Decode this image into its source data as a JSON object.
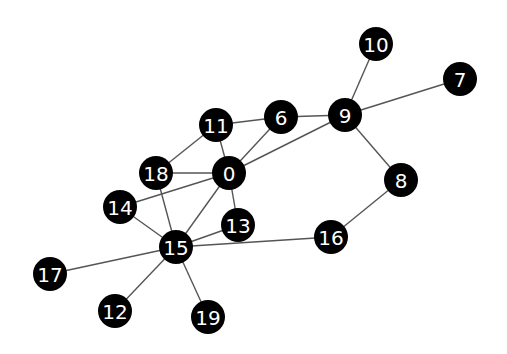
{
  "diagram": {
    "type": "undirected-graph",
    "node_color": "#000000",
    "label_color": "#ffffff",
    "edge_color": "#555555",
    "node_radius": 17,
    "nodes": [
      {
        "id": "0",
        "x": 229,
        "y": 173
      },
      {
        "id": "6",
        "x": 281,
        "y": 117
      },
      {
        "id": "7",
        "x": 460,
        "y": 79
      },
      {
        "id": "8",
        "x": 401,
        "y": 180
      },
      {
        "id": "9",
        "x": 345,
        "y": 115
      },
      {
        "id": "10",
        "x": 376,
        "y": 44
      },
      {
        "id": "11",
        "x": 216,
        "y": 125
      },
      {
        "id": "12",
        "x": 115,
        "y": 311
      },
      {
        "id": "13",
        "x": 238,
        "y": 225
      },
      {
        "id": "14",
        "x": 120,
        "y": 207
      },
      {
        "id": "15",
        "x": 176,
        "y": 247
      },
      {
        "id": "16",
        "x": 331,
        "y": 237
      },
      {
        "id": "17",
        "x": 50,
        "y": 274
      },
      {
        "id": "18",
        "x": 156,
        "y": 173
      },
      {
        "id": "19",
        "x": 208,
        "y": 317
      }
    ],
    "edges": [
      [
        "11",
        "6"
      ],
      [
        "11",
        "18"
      ],
      [
        "11",
        "0"
      ],
      [
        "18",
        "0"
      ],
      [
        "18",
        "15"
      ],
      [
        "0",
        "6"
      ],
      [
        "0",
        "9"
      ],
      [
        "0",
        "14"
      ],
      [
        "0",
        "13"
      ],
      [
        "0",
        "15"
      ],
      [
        "6",
        "9"
      ],
      [
        "9",
        "10"
      ],
      [
        "9",
        "7"
      ],
      [
        "9",
        "8"
      ],
      [
        "8",
        "16"
      ],
      [
        "16",
        "15"
      ],
      [
        "14",
        "15"
      ],
      [
        "13",
        "15"
      ],
      [
        "15",
        "17"
      ],
      [
        "15",
        "12"
      ],
      [
        "15",
        "19"
      ]
    ]
  }
}
